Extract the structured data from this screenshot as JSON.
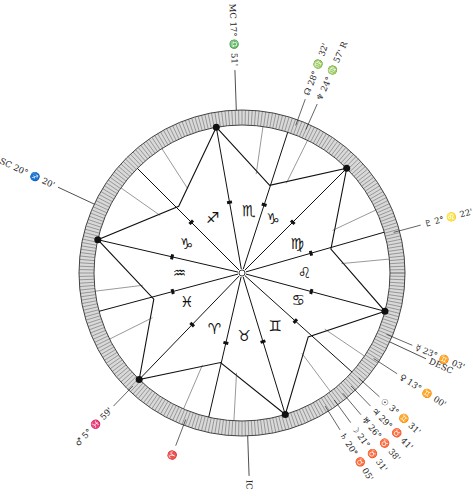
{
  "chart": {
    "center": [
      242,
      273
    ],
    "ring_outer_radius": 163,
    "ring_inner_radius": 148,
    "star_inner_radius": 92,
    "rotation_deg": -105,
    "colors": {
      "line": "#111111",
      "ring_fill": "#d9d9d9",
      "ring_hatch": "#555555",
      "background": "#ffffff"
    }
  },
  "angles": {
    "asc": {
      "label": "ASC 20° ♐ 20'",
      "angle": 155
    },
    "mc": {
      "label": "MC 17° ♎ 51'",
      "angle": 92
    },
    "desc": {
      "label": "DESC",
      "angle": 335
    },
    "ic": {
      "label": "IC",
      "angle": 272
    }
  },
  "signs": [
    {
      "name": "scorpio",
      "glyph": "♏",
      "angle": 84
    },
    {
      "name": "libra-like-capricorn",
      "glyph": "♑",
      "angle": 60
    },
    {
      "name": "virgo",
      "glyph": "♍",
      "angle": 28
    },
    {
      "name": "leo",
      "glyph": "♌",
      "angle": 0
    },
    {
      "name": "cancer",
      "glyph": "♋",
      "angle": 334
    },
    {
      "name": "gemini",
      "glyph": "♊",
      "angle": 302
    },
    {
      "name": "taurus",
      "glyph": "♉",
      "angle": 272
    },
    {
      "name": "aries",
      "glyph": "♈",
      "angle": 244
    },
    {
      "name": "pisces",
      "glyph": "♓",
      "angle": 208
    },
    {
      "name": "aquarius",
      "glyph": "♒",
      "angle": 180
    },
    {
      "name": "capricorn",
      "glyph": "♑",
      "angle": 152
    },
    {
      "name": "sagittarius",
      "glyph": "♐",
      "angle": 118
    }
  ],
  "cusps": [
    100,
    72,
    45,
    16,
    345,
    318,
    287,
    257,
    226,
    195,
    167,
    135
  ],
  "star_points": [
    100,
    45,
    345,
    287,
    226,
    167
  ],
  "planets": [
    {
      "name": "neptune-node",
      "label": "☊ 28° ♍ 32'",
      "angle": 70
    },
    {
      "name": "neptune",
      "label": "♆ 24° ♍ 57' R",
      "angle": 66
    },
    {
      "name": "pluto",
      "label": "♇ 2° ♌ 22'",
      "angle": 15
    },
    {
      "name": "mercury",
      "label": "☿ 23° ♊ 03'",
      "angle": 337
    },
    {
      "name": "venus",
      "label": "♀ 13° ♊ 00'",
      "angle": 327
    },
    {
      "name": "sun",
      "label": "☉ 3° ♊ 31'",
      "angle": 318
    },
    {
      "name": "jupiter",
      "label": "♃ 29° ♉ 41'",
      "angle": 314
    },
    {
      "name": "uranus",
      "label": "♅ 26° ♉ 38'",
      "angle": 310
    },
    {
      "name": "moon",
      "label": "☽ 21° ♉ 31'",
      "angle": 306
    },
    {
      "name": "saturn",
      "label": "♄ 20° ♉ 05'",
      "angle": 302
    },
    {
      "name": "mars",
      "label": "♂ 5° ♓ 59'",
      "angle": 226
    },
    {
      "name": "aries-point",
      "label": "♈",
      "angle": 249
    }
  ]
}
